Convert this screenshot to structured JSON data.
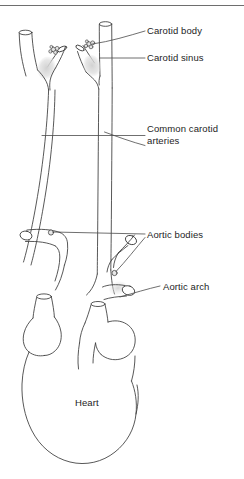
{
  "figure": {
    "width": 244,
    "height": 479,
    "background_color": "#ffffff",
    "line_color": "#3a3a3a",
    "text_color": "#1d1d1d",
    "shading_color": "#d9d9d9",
    "top_rule_color": "#6e6e6e"
  },
  "labels": {
    "carotid_body": "Carotid body",
    "carotid_sinus": "Carotid sinus",
    "common_carotid_arteries": "Common carotid\narteries",
    "aortic_bodies": "Aortic bodies",
    "aortic_arch": "Aortic arch",
    "heart": "Heart"
  },
  "structures": [
    {
      "name": "left-carotid-bifurcation",
      "label_ref": "carotid_body",
      "description": "Left carotid artery bifurcation with carotid body cluster and shaded carotid sinus bulge"
    },
    {
      "name": "right-carotid-bifurcation",
      "label_ref": "carotid_sinus",
      "description": "Right carotid artery bifurcation with carotid body cluster and shaded carotid sinus bulge"
    },
    {
      "name": "common-carotid-arteries",
      "label_ref": "common_carotid_arteries",
      "description": "Paired long vessels descending from the carotid bifurcations toward the aortic arch"
    },
    {
      "name": "aortic-arch",
      "label_ref": "aortic_arch",
      "description": "Curved arch of the aorta emerging from the heart with great-vessel branches"
    },
    {
      "name": "aortic-bodies",
      "label_ref": "aortic_bodies",
      "description": "Two small nodules on the aortic arch branches acting as chemoreceptors"
    },
    {
      "name": "heart",
      "label_ref": "heart",
      "description": "Outline of the heart at the base of the diagram"
    }
  ],
  "leader_lines": [
    {
      "name": "leader-carotid-body",
      "to": "right carotid body cluster"
    },
    {
      "name": "leader-carotid-sinus",
      "to": "right carotid sinus bulge"
    },
    {
      "name": "leader-common-carotid-upper",
      "to": "left common carotid artery"
    },
    {
      "name": "leader-common-carotid-lower",
      "to": "right common carotid artery"
    },
    {
      "name": "leader-aortic-bodies-left",
      "to": "left aortic body nodule"
    },
    {
      "name": "leader-aortic-bodies-right",
      "to": "right aortic body nodule"
    },
    {
      "name": "leader-aortic-arch",
      "to": "aortic arch vessel"
    }
  ]
}
